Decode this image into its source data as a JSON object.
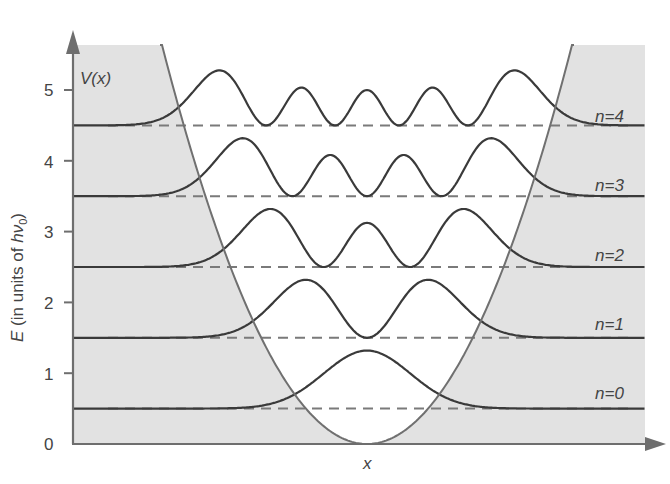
{
  "figure": {
    "potential_label": "V(x)",
    "x_axis_label": "x",
    "y_axis_label": "E (in units of hν0)",
    "y_axis_label_parts": {
      "prefix": "E",
      "mid": " (in units of ",
      "h": "h",
      "nu": "ν",
      "sub": "0",
      "suffix": ")"
    },
    "y_ticks": [
      "0",
      "1",
      "2",
      "3",
      "4",
      "5"
    ],
    "levels": [
      {
        "n": 0,
        "label": "n=0",
        "energy": 0.5
      },
      {
        "n": 1,
        "label": "n=1",
        "energy": 1.5
      },
      {
        "n": 2,
        "label": "n=2",
        "energy": 2.5
      },
      {
        "n": 3,
        "label": "n=3",
        "energy": 3.5
      },
      {
        "n": 4,
        "label": "n=4",
        "energy": 4.5
      }
    ],
    "colors": {
      "forbidden_region": "#e2e2e2",
      "curve": "#3a3a3a",
      "axis": "#6e6e6e",
      "dashed": "#7a7a7a",
      "text": "#444444"
    }
  },
  "chart_data": {
    "type": "line",
    "title": "",
    "xlabel": "x",
    "ylabel": "E (in units of hν0)",
    "ylim": [
      0,
      5.6
    ],
    "yticks": [
      0,
      1,
      2,
      3,
      4,
      5
    ],
    "potential": "V(x) = parabola with minimum 0 at x = 0",
    "series": [
      {
        "name": "n=0",
        "baseline": 0.5,
        "peaks": 1,
        "peak_height": 0.8
      },
      {
        "name": "n=1",
        "baseline": 1.5,
        "peaks": 2,
        "peak_height": 0.8
      },
      {
        "name": "n=2",
        "baseline": 2.5,
        "peaks": 3,
        "peak_height": 0.8
      },
      {
        "name": "n=3",
        "baseline": 3.5,
        "peaks": 4,
        "peak_height": 0.8
      },
      {
        "name": "n=4",
        "baseline": 4.5,
        "peaks": 5,
        "peak_height": 0.7
      }
    ],
    "grid": false,
    "annotations": [
      "V(x)",
      "n=0",
      "n=1",
      "n=2",
      "n=3",
      "n=4"
    ]
  }
}
